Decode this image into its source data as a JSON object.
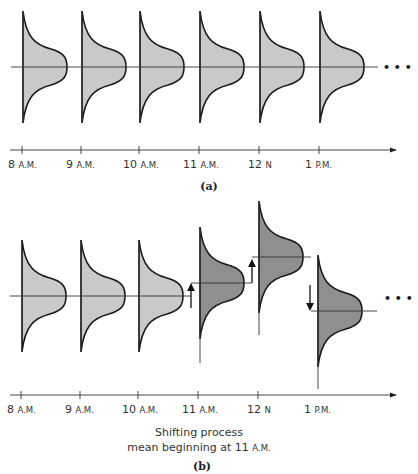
{
  "panel_a": {
    "caption": "(a)",
    "ellipsis": "• • •",
    "time_labels": [
      {
        "num": "8",
        "suffix": "A.M."
      },
      {
        "num": "9",
        "suffix": "A.M."
      },
      {
        "num": "10",
        "suffix": "A.M."
      },
      {
        "num": "11",
        "suffix": "A.M."
      },
      {
        "num": "12",
        "suffix": "N"
      },
      {
        "num": "1",
        "suffix": "P.M."
      }
    ],
    "distributions": [
      {
        "time": "8 A.M.",
        "mean": "in-control",
        "fill": "#c9c9c9"
      },
      {
        "time": "9 A.M.",
        "mean": "in-control",
        "fill": "#c9c9c9"
      },
      {
        "time": "10 A.M.",
        "mean": "in-control",
        "fill": "#c9c9c9"
      },
      {
        "time": "11 A.M.",
        "mean": "in-control",
        "fill": "#c9c9c9"
      },
      {
        "time": "12 N",
        "mean": "in-control",
        "fill": "#c9c9c9"
      },
      {
        "time": "1 P.M.",
        "mean": "in-control",
        "fill": "#c9c9c9"
      }
    ]
  },
  "panel_b": {
    "caption": "(b)",
    "ellipsis": "• • •",
    "note_line1": "Shifting process",
    "note_line2_prefix": "mean beginning at 11",
    "note_line2_suffix": "A.M.",
    "time_labels": [
      {
        "num": "8",
        "suffix": "A.M."
      },
      {
        "num": "9",
        "suffix": "A.M."
      },
      {
        "num": "10",
        "suffix": "A.M."
      },
      {
        "num": "11",
        "suffix": "A.M."
      },
      {
        "num": "12",
        "suffix": "N"
      },
      {
        "num": "1",
        "suffix": "P.M."
      }
    ],
    "distributions": [
      {
        "time": "8 A.M.",
        "shift": "none",
        "fill": "#c9c9c9"
      },
      {
        "time": "9 A.M.",
        "shift": "none",
        "fill": "#c9c9c9"
      },
      {
        "time": "10 A.M.",
        "shift": "none",
        "fill": "#c9c9c9"
      },
      {
        "time": "11 A.M.",
        "shift": "up",
        "fill": "#8f8f8f"
      },
      {
        "time": "12 N",
        "shift": "up",
        "fill": "#8f8f8f"
      },
      {
        "time": "1 P.M.",
        "shift": "down",
        "fill": "#8f8f8f"
      }
    ]
  },
  "colors": {
    "in_control_fill": "#c9c9c9",
    "shifted_fill": "#8f8f8f",
    "stroke": "#1a1a1a",
    "axis": "#333333"
  }
}
